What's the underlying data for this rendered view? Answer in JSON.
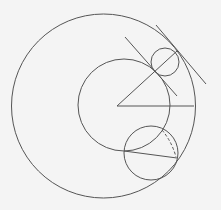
{
  "diagram": {
    "stroke_color": "#555555",
    "background": "#f4f4f4",
    "outer_circle": {
      "cx": 103.5,
      "cy": 106,
      "r": 92
    },
    "inner_circle": {
      "cx": 124,
      "cy": 105,
      "r": 46
    },
    "small_circle": {
      "cx": 165,
      "cy": 62,
      "r": 14
    },
    "lower_circle": {
      "cx": 151,
      "cy": 153,
      "r": 27
    }
  }
}
